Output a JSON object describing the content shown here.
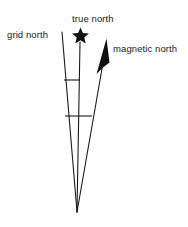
{
  "diagram": {
    "type": "declination-diagram",
    "title": "",
    "background_color": "#ffffff",
    "stroke_color": "#1a1a1a",
    "labels": {
      "grid_north": "grid north",
      "true_north": "true north",
      "magnetic_north": "magnetic north"
    },
    "icons": {
      "true_north_marker": "star-icon",
      "magnetic_north_marker": "filled-arrowhead-icon"
    },
    "geometry": {
      "convergence_point": {
        "x": 77,
        "y": 212
      },
      "grid_north_line": {
        "x1": 62,
        "y1": 32,
        "x2": 77,
        "y2": 212
      },
      "true_north_line": {
        "x1": 80,
        "y1": 42,
        "x2": 77,
        "y2": 212
      },
      "magnetic_north_line": {
        "x1": 104,
        "y1": 62,
        "x2": 77,
        "y2": 212
      },
      "star_center": {
        "x": 80,
        "y": 34
      },
      "crossbar_upper": {
        "x1": 64,
        "y1": 80,
        "x2": 80,
        "y2": 80
      },
      "crossbar_lower": {
        "x1": 65,
        "y1": 116,
        "x2": 92,
        "y2": 116
      }
    }
  }
}
